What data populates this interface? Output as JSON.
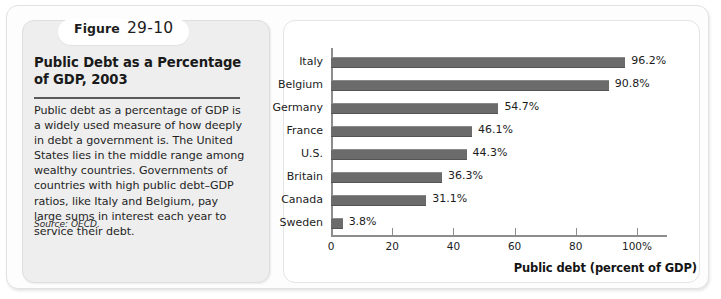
{
  "figure": {
    "badge_word": "Figure",
    "badge_number": "29-10",
    "title": "Public Debt as a Percentage of GDP, 2003",
    "body": "Public debt as a percentage of GDP is a widely used measure of how deeply in debt a government is. The United States lies in the middle range among wealthy countries. Governments of countries with high public debt–GDP ratios, like Italy and Belgium, pay large sums in interest each year to service their debt.",
    "source": "Source: OECD."
  },
  "colors": {
    "bar": "#6b6b6b",
    "card_background": "#eeeeee",
    "axis": "#8d8d8d"
  },
  "chart_data": {
    "type": "bar",
    "orientation": "horizontal",
    "title": "Public Debt as a Percentage of GDP, 2003",
    "categories": [
      "Italy",
      "Belgium",
      "Germany",
      "France",
      "U.S.",
      "Britain",
      "Canada",
      "Sweden"
    ],
    "values": [
      96.2,
      90.8,
      54.7,
      46.1,
      44.3,
      36.3,
      31.1,
      3.8
    ],
    "data_labels": [
      "96.2%",
      "90.8%",
      "54.7%",
      "46.1%",
      "44.3%",
      "36.3%",
      "31.1%",
      "3.8%"
    ],
    "xlabel": "Public debt (percent of GDP)",
    "ylabel": "",
    "xlim": [
      0,
      110
    ],
    "xticks": [
      0,
      20,
      40,
      60,
      80,
      100
    ],
    "xtick_labels": [
      "0",
      "20",
      "40",
      "60",
      "80",
      "100%"
    ],
    "grid": false,
    "legend": false
  }
}
